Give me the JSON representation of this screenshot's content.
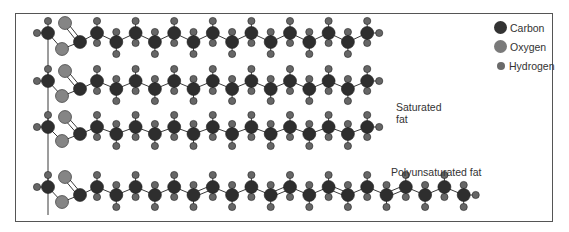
{
  "diagram": {
    "labels": {
      "saturated": [
        "Saturated",
        "fat"
      ],
      "polyunsaturated": "Polyunsaturated fat"
    },
    "legend": [
      {
        "label": "Carbon",
        "color": "#333333",
        "size": 13
      },
      {
        "label": "Oxygen",
        "color": "#7a7a7a",
        "size": 13
      },
      {
        "label": "Hydrogen",
        "color": "#6a6a6a",
        "size": 8
      }
    ],
    "colors": {
      "carbon": "#2e2e2e",
      "oxygen": "#858585",
      "hydrogen": "#666666",
      "bond": "#3a3a3a",
      "border": "#555555"
    },
    "chains": [
      {
        "name": "saturated-chain-1",
        "y_up": 33,
        "y_down": 42,
        "carbons": 15,
        "double_bonds": []
      },
      {
        "name": "saturated-chain-2",
        "y_up": 81,
        "y_down": 89,
        "carbons": 15,
        "double_bonds": []
      },
      {
        "name": "saturated-chain-3",
        "y_up": 127,
        "y_down": 134,
        "carbons": 15,
        "double_bonds": []
      },
      {
        "name": "polyunsaturated-chain",
        "y_up": 187,
        "y_down": 195,
        "carbons": 20,
        "double_bonds": [
          6,
          10,
          13,
          16
        ]
      }
    ]
  }
}
